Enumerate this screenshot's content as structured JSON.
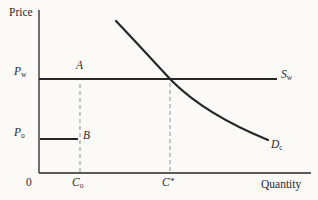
{
  "figure": {
    "y_axis_title": "Price",
    "x_axis_title": "Quantity",
    "origin_label": "0",
    "labels": {
      "pw": {
        "base": "P",
        "sub": "w"
      },
      "po": {
        "base": "P",
        "sub": "o"
      },
      "sw": {
        "base": "S",
        "sub": "w"
      },
      "dc": {
        "base": "D",
        "sub": "c"
      },
      "a": "A",
      "b": "B",
      "co": {
        "base": "C",
        "sub": "o"
      },
      "cstar": {
        "base": "C",
        "sup": "*"
      }
    },
    "colors": {
      "background": "#fbfaf7",
      "ink": "#262626",
      "dashed": "#8f8f8f"
    }
  },
  "chart_data": {
    "type": "line",
    "title": "",
    "xlabel": "Quantity",
    "ylabel": "Price",
    "axis_numeric": false,
    "description": [
      "Horizontal world supply line S_w at price P_w crossing demand curve D_c at quantity C*",
      "Short horizontal segment at lower price P_o from axis to point B at quantity C_o",
      "Point A lies on the P_w line at quantity C_o",
      "Dashed vertical droplines at C_o and C*",
      "Demand curve D_c is downward sloping and convex"
    ],
    "geometry": {
      "lines": [
        {
          "name": "y-axis",
          "x1": 39,
          "y1": 10,
          "x2": 39,
          "y2": 173,
          "w": 1.3,
          "dash": "",
          "color": "#262626"
        },
        {
          "name": "x-axis",
          "x1": 39,
          "y1": 173,
          "x2": 311,
          "y2": 173,
          "w": 1.3,
          "dash": "",
          "color": "#262626"
        },
        {
          "name": "world-supply-line",
          "x1": 39,
          "y1": 79,
          "x2": 277,
          "y2": 79,
          "w": 2,
          "dash": "",
          "color": "#262626"
        },
        {
          "name": "po-price-segment",
          "x1": 40,
          "y1": 139,
          "x2": 78,
          "y2": 139,
          "w": 2.2,
          "dash": "",
          "color": "#262626"
        },
        {
          "name": "co-dropline",
          "x1": 80,
          "y1": 84,
          "x2": 80,
          "y2": 172,
          "w": 1,
          "dash": "4 3",
          "color": "#8f8f8f"
        },
        {
          "name": "cstar-dropline",
          "x1": 170,
          "y1": 83,
          "x2": 170,
          "y2": 172,
          "w": 1,
          "dash": "4 3",
          "color": "#8f8f8f"
        }
      ],
      "curves": [
        {
          "name": "demand-curve",
          "path": "M116,21 C137,43 155,63 172,81 C195,104 229,124 268,140",
          "w": 2.2,
          "color": "#262626"
        }
      ]
    }
  }
}
